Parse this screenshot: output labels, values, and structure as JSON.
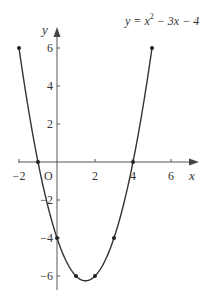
{
  "chart_data": {
    "type": "line",
    "equation": {
      "prefix": "y = x",
      "sup": "2",
      "suffix": " − 3x − 4"
    },
    "xlabel": "x",
    "ylabel": "y",
    "origin_label": "O",
    "x": [
      -2,
      -1,
      0,
      1,
      2,
      3,
      4,
      5
    ],
    "series": [
      {
        "name": "y = x² − 3x − 4",
        "values": [
          6,
          0,
          -4,
          -6,
          -6,
          -4,
          0,
          6
        ]
      }
    ],
    "xlim": [
      -2.3,
      7
    ],
    "ylim": [
      -6.7,
      7.2
    ],
    "x_ticks": [
      -2,
      2,
      4,
      6
    ],
    "x_tick_labels": [
      "−2",
      "2",
      "4",
      "6"
    ],
    "y_ticks": [
      6,
      4,
      2,
      -2,
      -4,
      -6
    ],
    "y_tick_labels": [
      "6",
      "4",
      "2",
      "−2",
      "−4",
      "−6"
    ],
    "grid": false,
    "legend": "none",
    "colors": {
      "curve": "#333333",
      "axes": "#555555",
      "points": "#222222"
    }
  }
}
